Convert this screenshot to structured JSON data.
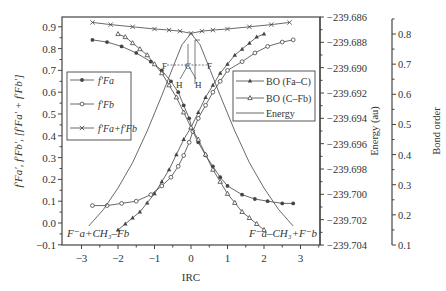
{
  "chart_data": {
    "type": "line",
    "title": "",
    "xlabel": "IRC",
    "ylabel_left": "f_Fa', f_Fb', [f_Fa' + f_Fb']",
    "ylabel_right1": "Energy (au)",
    "ylabel_right2": "Bond order",
    "xlim": [
      -3.5,
      3.5
    ],
    "ylim_left": [
      -0.1,
      0.95
    ],
    "ylim_energy": [
      -239.704,
      -239.686
    ],
    "ylim_bond": [
      0.1,
      0.85
    ],
    "x_ticks": [
      "-3",
      "-2",
      "-1",
      "0",
      "1",
      "2",
      "3"
    ],
    "y_ticks_left": [
      "-0.1",
      "0.0",
      "0.1",
      "0.2",
      "0.3",
      "0.4",
      "0.5",
      "0.6",
      "0.7",
      "0.8",
      "0.9"
    ],
    "y_ticks_energy": [
      "-239.704",
      "-239.702",
      "-239.700",
      "-239.698",
      "-239.696",
      "-239.694",
      "-239.692",
      "-239.690",
      "-239.688",
      "-239.686"
    ],
    "y_ticks_bond": [
      "0.1",
      "0.2",
      "0.3",
      "0.4",
      "0.5",
      "0.6",
      "0.7",
      "0.8"
    ],
    "annotations": {
      "left_bottom": "F⁻a + CH3–Fb",
      "right_bottom": "F⁻a–CH3 + F⁻b",
      "molecule_atoms": [
        "F",
        "C",
        "F",
        "H",
        "H"
      ]
    },
    "legend_left": [
      "f_Fa",
      "f_Fb",
      "f_Fa + f_Fb"
    ],
    "legend_right": [
      "BO (Fa–C)",
      "BO (C–Fb)",
      "Energy"
    ],
    "series": [
      {
        "name": "f_Fa",
        "axis": "left",
        "marker": "filled-circle",
        "x": [
          -2.7,
          -2.3,
          -1.9,
          -1.5,
          -1.1,
          -0.8,
          -0.55,
          -0.35,
          -0.2,
          -0.05,
          0.05,
          0.2,
          0.4,
          0.6,
          0.8,
          1.0,
          1.4,
          1.75,
          2.1,
          2.5,
          2.8
        ],
        "y": [
          0.84,
          0.83,
          0.81,
          0.78,
          0.74,
          0.7,
          0.65,
          0.6,
          0.54,
          0.48,
          0.42,
          0.37,
          0.31,
          0.26,
          0.21,
          0.17,
          0.13,
          0.11,
          0.1,
          0.09,
          0.09
        ]
      },
      {
        "name": "f_Fb",
        "axis": "left",
        "marker": "open-circle",
        "x": [
          -2.7,
          -2.3,
          -1.9,
          -1.5,
          -1.1,
          -0.8,
          -0.55,
          -0.35,
          -0.2,
          -0.05,
          0.05,
          0.2,
          0.4,
          0.6,
          0.8,
          1.0,
          1.4,
          1.75,
          2.1,
          2.5,
          2.8
        ],
        "y": [
          0.08,
          0.08,
          0.09,
          0.1,
          0.13,
          0.17,
          0.21,
          0.26,
          0.31,
          0.37,
          0.42,
          0.48,
          0.54,
          0.6,
          0.65,
          0.7,
          0.74,
          0.78,
          0.81,
          0.83,
          0.84
        ]
      },
      {
        "name": "f_Fa + f_Fb",
        "axis": "left",
        "marker": "x",
        "x": [
          -2.7,
          -2.2,
          -1.6,
          -1.0,
          -0.6,
          -0.3,
          0.0,
          0.3,
          0.6,
          1.0,
          1.6,
          2.2,
          2.7
        ],
        "y": [
          0.92,
          0.91,
          0.9,
          0.89,
          0.885,
          0.88,
          0.87,
          0.88,
          0.885,
          0.89,
          0.9,
          0.91,
          0.92
        ]
      },
      {
        "name": "BO (Fa–C)",
        "axis": "bond",
        "marker": "filled-triangle",
        "x": [
          -2.0,
          -1.8,
          -1.6,
          -1.4,
          -1.2,
          -1.0,
          -0.8,
          -0.6,
          -0.4,
          -0.2,
          0.0,
          0.2,
          0.4,
          0.6,
          0.8,
          1.0,
          1.2,
          1.4,
          1.6,
          1.8,
          2.0
        ],
        "y": [
          0.15,
          0.17,
          0.19,
          0.21,
          0.24,
          0.27,
          0.31,
          0.35,
          0.4,
          0.45,
          0.49,
          0.54,
          0.59,
          0.63,
          0.67,
          0.7,
          0.73,
          0.75,
          0.77,
          0.79,
          0.8
        ]
      },
      {
        "name": "BO (C–Fb)",
        "axis": "bond",
        "marker": "open-triangle",
        "x": [
          -2.0,
          -1.8,
          -1.6,
          -1.4,
          -1.2,
          -1.0,
          -0.8,
          -0.6,
          -0.4,
          -0.2,
          0.0,
          0.2,
          0.4,
          0.6,
          0.8,
          1.0,
          1.2,
          1.4,
          1.6,
          1.8,
          2.0
        ],
        "y": [
          0.8,
          0.79,
          0.77,
          0.75,
          0.73,
          0.7,
          0.67,
          0.63,
          0.59,
          0.54,
          0.49,
          0.45,
          0.4,
          0.35,
          0.31,
          0.27,
          0.24,
          0.21,
          0.19,
          0.17,
          0.15
        ]
      },
      {
        "name": "Energy",
        "axis": "energy",
        "marker": "none",
        "x": [
          -2.8,
          -2.4,
          -2.0,
          -1.6,
          -1.2,
          -0.8,
          -0.5,
          -0.25,
          0.0,
          0.25,
          0.5,
          0.8,
          1.2,
          1.6,
          2.0,
          2.4,
          2.8
        ],
        "y": [
          -239.7025,
          -239.7012,
          -239.6995,
          -239.6975,
          -239.695,
          -239.6922,
          -239.69,
          -239.6882,
          -239.6873,
          -239.6882,
          -239.69,
          -239.6922,
          -239.695,
          -239.6975,
          -239.6995,
          -239.7012,
          -239.7025
        ]
      }
    ]
  }
}
